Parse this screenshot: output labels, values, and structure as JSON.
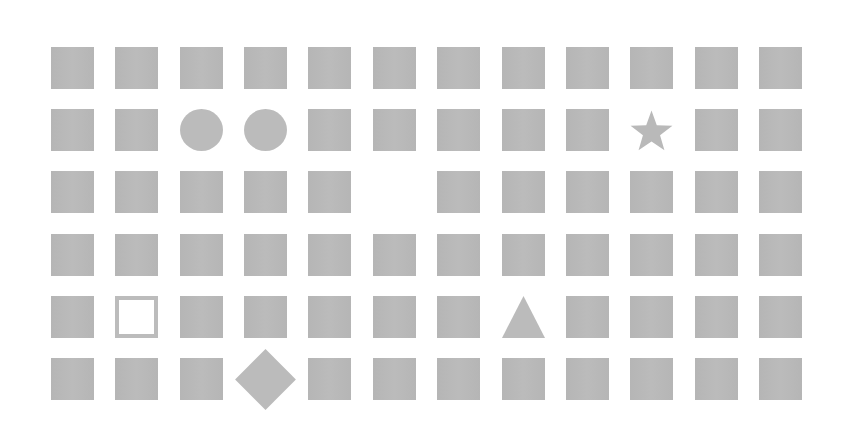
{
  "grid": {
    "rows": 6,
    "cols": 12,
    "origin_x": 51,
    "origin_y": 47,
    "pitch_x": 64.36,
    "pitch_y": 62.2,
    "cell_width": 43,
    "cell_height": 42,
    "fill_color": "#b9b9b9",
    "background_color": "#ffffff",
    "default_shape": "square",
    "special_cells": [
      {
        "row": 1,
        "col": 2,
        "shape": "circle"
      },
      {
        "row": 1,
        "col": 3,
        "shape": "circle"
      },
      {
        "row": 1,
        "col": 9,
        "shape": "star"
      },
      {
        "row": 2,
        "col": 5,
        "shape": "blank"
      },
      {
        "row": 4,
        "col": 1,
        "shape": "hollow-square"
      },
      {
        "row": 4,
        "col": 7,
        "shape": "triangle"
      },
      {
        "row": 5,
        "col": 3,
        "shape": "diamond"
      }
    ]
  }
}
